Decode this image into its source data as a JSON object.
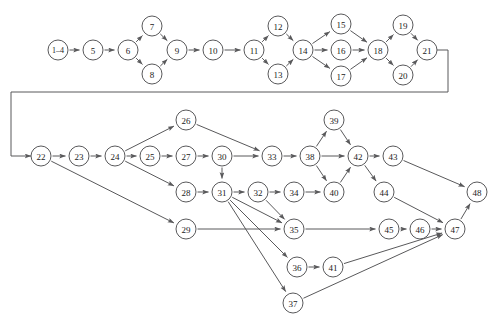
{
  "diagram": {
    "node_radius": 10,
    "stroke_color": "#59595b",
    "node_fill": "#ffffff",
    "label_color": "#1b1b1b",
    "nodes": [
      {
        "id": "1-4",
        "label": "1–4",
        "x": 58,
        "y": 50
      },
      {
        "id": "5",
        "label": "5",
        "x": 93,
        "y": 50
      },
      {
        "id": "6",
        "label": "6",
        "x": 128,
        "y": 50
      },
      {
        "id": "7",
        "label": "7",
        "x": 152,
        "y": 26
      },
      {
        "id": "8",
        "label": "8",
        "x": 152,
        "y": 74
      },
      {
        "id": "9",
        "label": "9",
        "x": 177,
        "y": 50
      },
      {
        "id": "10",
        "label": "10",
        "x": 213,
        "y": 50
      },
      {
        "id": "11",
        "label": "11",
        "x": 254,
        "y": 50
      },
      {
        "id": "12",
        "label": "12",
        "x": 278,
        "y": 26
      },
      {
        "id": "13",
        "label": "13",
        "x": 278,
        "y": 74
      },
      {
        "id": "14",
        "label": "14",
        "x": 303,
        "y": 50
      },
      {
        "id": "15",
        "label": "15",
        "x": 341,
        "y": 24
      },
      {
        "id": "16",
        "label": "16",
        "x": 341,
        "y": 50
      },
      {
        "id": "17",
        "label": "17",
        "x": 341,
        "y": 76
      },
      {
        "id": "18",
        "label": "18",
        "x": 378,
        "y": 50
      },
      {
        "id": "19",
        "label": "19",
        "x": 403,
        "y": 25
      },
      {
        "id": "20",
        "label": "20",
        "x": 403,
        "y": 75
      },
      {
        "id": "21",
        "label": "21",
        "x": 427,
        "y": 50
      },
      {
        "id": "22",
        "label": "22",
        "x": 41,
        "y": 156
      },
      {
        "id": "23",
        "label": "23",
        "x": 79,
        "y": 156
      },
      {
        "id": "24",
        "label": "24",
        "x": 115,
        "y": 156
      },
      {
        "id": "25",
        "label": "25",
        "x": 150,
        "y": 156
      },
      {
        "id": "26",
        "label": "26",
        "x": 186,
        "y": 120
      },
      {
        "id": "27",
        "label": "27",
        "x": 186,
        "y": 156
      },
      {
        "id": "28",
        "label": "28",
        "x": 186,
        "y": 192
      },
      {
        "id": "29",
        "label": "29",
        "x": 186,
        "y": 229
      },
      {
        "id": "30",
        "label": "30",
        "x": 222,
        "y": 156
      },
      {
        "id": "31",
        "label": "31",
        "x": 222,
        "y": 192
      },
      {
        "id": "32",
        "label": "32",
        "x": 258,
        "y": 192
      },
      {
        "id": "33",
        "label": "33",
        "x": 272,
        "y": 156
      },
      {
        "id": "34",
        "label": "34",
        "x": 294,
        "y": 192
      },
      {
        "id": "35",
        "label": "35",
        "x": 294,
        "y": 229
      },
      {
        "id": "36",
        "label": "36",
        "x": 297,
        "y": 267
      },
      {
        "id": "37",
        "label": "37",
        "x": 293,
        "y": 303
      },
      {
        "id": "38",
        "label": "38",
        "x": 310,
        "y": 156
      },
      {
        "id": "39",
        "label": "39",
        "x": 334,
        "y": 120
      },
      {
        "id": "40",
        "label": "40",
        "x": 334,
        "y": 192
      },
      {
        "id": "41",
        "label": "41",
        "x": 333,
        "y": 267
      },
      {
        "id": "42",
        "label": "42",
        "x": 358,
        "y": 156
      },
      {
        "id": "43",
        "label": "43",
        "x": 393,
        "y": 156
      },
      {
        "id": "44",
        "label": "44",
        "x": 384,
        "y": 192
      },
      {
        "id": "45",
        "label": "45",
        "x": 389,
        "y": 229
      },
      {
        "id": "46",
        "label": "46",
        "x": 420,
        "y": 229
      },
      {
        "id": "47",
        "label": "47",
        "x": 455,
        "y": 229
      },
      {
        "id": "48",
        "label": "48",
        "x": 477,
        "y": 192
      }
    ],
    "edges": [
      {
        "from": "1-4",
        "to": "5"
      },
      {
        "from": "5",
        "to": "6"
      },
      {
        "from": "6",
        "to": "7"
      },
      {
        "from": "6",
        "to": "8"
      },
      {
        "from": "7",
        "to": "9"
      },
      {
        "from": "8",
        "to": "9"
      },
      {
        "from": "9",
        "to": "10"
      },
      {
        "from": "10",
        "to": "11"
      },
      {
        "from": "11",
        "to": "12"
      },
      {
        "from": "11",
        "to": "13"
      },
      {
        "from": "12",
        "to": "14"
      },
      {
        "from": "13",
        "to": "14"
      },
      {
        "from": "14",
        "to": "15"
      },
      {
        "from": "14",
        "to": "16"
      },
      {
        "from": "14",
        "to": "17"
      },
      {
        "from": "15",
        "to": "18"
      },
      {
        "from": "16",
        "to": "18"
      },
      {
        "from": "17",
        "to": "18"
      },
      {
        "from": "18",
        "to": "19"
      },
      {
        "from": "18",
        "to": "20"
      },
      {
        "from": "19",
        "to": "21"
      },
      {
        "from": "20",
        "to": "21"
      },
      {
        "from": "22",
        "to": "23"
      },
      {
        "from": "22",
        "to": "29"
      },
      {
        "from": "23",
        "to": "24"
      },
      {
        "from": "24",
        "to": "25"
      },
      {
        "from": "24",
        "to": "26"
      },
      {
        "from": "24",
        "to": "28"
      },
      {
        "from": "25",
        "to": "27"
      },
      {
        "from": "26",
        "to": "33"
      },
      {
        "from": "27",
        "to": "30"
      },
      {
        "from": "28",
        "to": "31"
      },
      {
        "from": "29",
        "to": "35"
      },
      {
        "from": "30",
        "to": "33"
      },
      {
        "from": "30",
        "to": "31"
      },
      {
        "from": "31",
        "to": "32"
      },
      {
        "from": "31",
        "to": "35"
      },
      {
        "from": "31",
        "to": "36"
      },
      {
        "from": "31",
        "to": "37"
      },
      {
        "from": "32",
        "to": "34"
      },
      {
        "from": "32",
        "to": "35"
      },
      {
        "from": "33",
        "to": "38"
      },
      {
        "from": "34",
        "to": "40"
      },
      {
        "from": "35",
        "to": "45"
      },
      {
        "from": "36",
        "to": "41"
      },
      {
        "from": "37",
        "to": "47"
      },
      {
        "from": "38",
        "to": "39"
      },
      {
        "from": "38",
        "to": "40"
      },
      {
        "from": "38",
        "to": "42"
      },
      {
        "from": "39",
        "to": "42"
      },
      {
        "from": "40",
        "to": "42"
      },
      {
        "from": "41",
        "to": "47"
      },
      {
        "from": "42",
        "to": "43"
      },
      {
        "from": "42",
        "to": "44"
      },
      {
        "from": "43",
        "to": "48"
      },
      {
        "from": "44",
        "to": "47"
      },
      {
        "from": "45",
        "to": "46"
      },
      {
        "from": "46",
        "to": "47"
      },
      {
        "from": "47",
        "to": "48"
      }
    ],
    "wrap_edge": {
      "from": "21",
      "to": "22",
      "description": "feedback line from node 21 around to node 22",
      "points": "437,50 448,50 448,92 11,92 11,156 31,156"
    }
  }
}
